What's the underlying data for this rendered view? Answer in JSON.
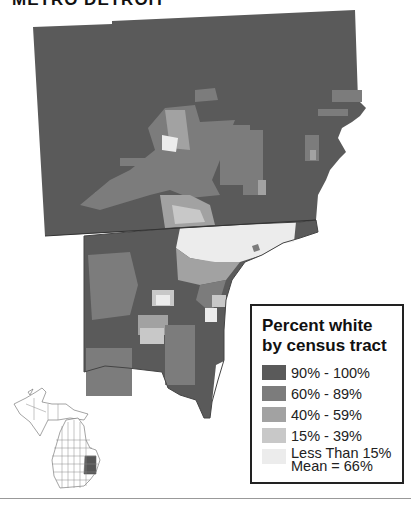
{
  "title": "METRO DETROIT",
  "legend": {
    "title_line1": "Percent white",
    "title_line2": "by census tract",
    "items": [
      {
        "label": "90% - 100%",
        "color": "#5a5a5a"
      },
      {
        "label": "60% - 89%",
        "color": "#7c7c7c"
      },
      {
        "label": "40% - 59%",
        "color": "#a2a2a2"
      },
      {
        "label": "15% - 39%",
        "color": "#c8c8c8"
      }
    ],
    "last_item": {
      "label": "Less Than 15%",
      "color": "#ececec"
    },
    "mean": "Mean = 66%"
  },
  "inset": {
    "label": "Michigan locator map",
    "highlight_color": "#555555"
  },
  "colors": {
    "c90": "#5a5a5a",
    "c60": "#7c7c7c",
    "c40": "#a2a2a2",
    "c15": "#c8c8c8",
    "c0": "#ececec"
  }
}
